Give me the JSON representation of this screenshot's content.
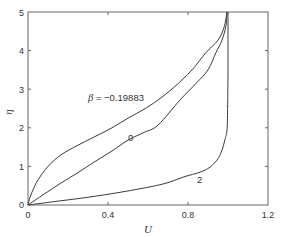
{
  "chart_data": {
    "type": "line",
    "title": "",
    "xlabel": "U",
    "ylabel": "η",
    "xlim": [
      0,
      1.2
    ],
    "ylim": [
      0,
      5
    ],
    "x_ticks": [
      0,
      0.4,
      0.8,
      1.2
    ],
    "x_tick_labels": [
      "0",
      "0.4",
      "0.8",
      "1.2"
    ],
    "y_ticks": [
      0,
      1,
      2,
      3,
      4,
      5
    ],
    "y_tick_labels": [
      "0",
      "1",
      "2",
      "3",
      "4",
      "5"
    ],
    "grid": false,
    "legend": null,
    "series": [
      {
        "name": "β = −0.19883",
        "label": "β = −0.19883",
        "points": [
          [
            0,
            0
          ],
          [
            0.01,
            0.2
          ],
          [
            0.03,
            0.45
          ],
          [
            0.05,
            0.65
          ],
          [
            0.1,
            1.0
          ],
          [
            0.165,
            1.3
          ],
          [
            0.25,
            1.55
          ],
          [
            0.33,
            1.76
          ],
          [
            0.42,
            2.0
          ],
          [
            0.5,
            2.25
          ],
          [
            0.58,
            2.48
          ],
          [
            0.65,
            2.72
          ],
          [
            0.73,
            3.05
          ],
          [
            0.82,
            3.5
          ],
          [
            0.89,
            3.95
          ],
          [
            0.95,
            4.27
          ],
          [
            0.98,
            4.6
          ],
          [
            0.995,
            5.0
          ]
        ]
      },
      {
        "name": "0",
        "label": "0",
        "points": [
          [
            0,
            0
          ],
          [
            0.08,
            0.28
          ],
          [
            0.165,
            0.57
          ],
          [
            0.25,
            0.84
          ],
          [
            0.33,
            1.11
          ],
          [
            0.42,
            1.4
          ],
          [
            0.5,
            1.68
          ],
          [
            0.58,
            1.88
          ],
          [
            0.65,
            2.07
          ],
          [
            0.76,
            2.72
          ],
          [
            0.84,
            3.15
          ],
          [
            0.9,
            3.5
          ],
          [
            0.94,
            3.95
          ],
          [
            0.97,
            4.27
          ],
          [
            0.99,
            4.65
          ],
          [
            0.995,
            5.0
          ]
        ]
      },
      {
        "name": "2",
        "label": "2",
        "points": [
          [
            0,
            0
          ],
          [
            0.15,
            0.1
          ],
          [
            0.3,
            0.2
          ],
          [
            0.45,
            0.32
          ],
          [
            0.61,
            0.47
          ],
          [
            0.7,
            0.58
          ],
          [
            0.78,
            0.73
          ],
          [
            0.86,
            0.85
          ],
          [
            0.91,
            0.98
          ],
          [
            0.95,
            1.2
          ],
          [
            0.97,
            1.42
          ],
          [
            0.985,
            1.7
          ],
          [
            0.995,
            1.94
          ],
          [
            0.998,
            2.5
          ],
          [
            1.0,
            3.5
          ],
          [
            1.0,
            5.0
          ]
        ]
      }
    ],
    "annotations": [
      {
        "text": "β = −0.19883",
        "x": 0.3,
        "y": 2.8
      },
      {
        "text": "0",
        "x": 0.51,
        "y": 1.73
      },
      {
        "text": "2",
        "x": 0.86,
        "y": 0.6
      }
    ]
  },
  "labels": {
    "xlabel": "U",
    "ylabel": "η",
    "annot_beta_symbol": "β",
    "annot_beta_value": " = −0.19883",
    "annot_zero": "0",
    "annot_two": "2",
    "xtick_0": "0",
    "xtick_1": "0.4",
    "xtick_2": "0.8",
    "xtick_3": "1.2",
    "ytick_0": "0",
    "ytick_1": "1",
    "ytick_2": "2",
    "ytick_3": "3",
    "ytick_4": "4",
    "ytick_5": "5"
  },
  "colors": {
    "line": "#3a3a3a",
    "axes": "#555555",
    "text": "#333333"
  }
}
